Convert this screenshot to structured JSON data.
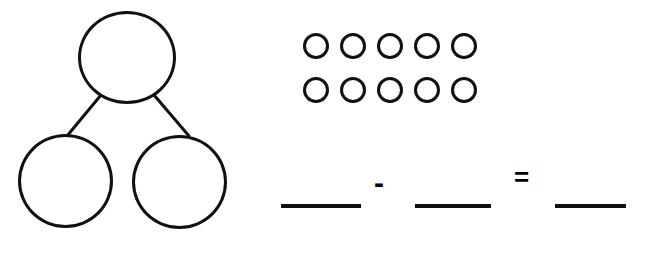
{
  "worksheet": {
    "type": "number-bond-subtraction",
    "background_color": "#ffffff",
    "ink_color": "#111111"
  },
  "number_bond": {
    "label": "number bond",
    "whole": {
      "name": "whole",
      "value": ""
    },
    "part_left": {
      "name": "part-left",
      "value": ""
    },
    "part_right": {
      "name": "part-right",
      "value": ""
    }
  },
  "counters": {
    "label": "counters",
    "total": 10,
    "shape": "circle-outline",
    "rows": [
      {
        "count": 5,
        "items": [
          "circle",
          "circle",
          "circle",
          "circle",
          "circle"
        ]
      },
      {
        "count": 5,
        "items": [
          "circle",
          "circle",
          "circle",
          "circle",
          "circle"
        ]
      }
    ]
  },
  "equation": {
    "label": "subtraction equation",
    "expression": "___ - ___ = ___",
    "minus_sign": "-",
    "equals_sign": "=",
    "blanks": [
      {
        "name": "minuend",
        "value": ""
      },
      {
        "name": "subtrahend",
        "value": ""
      },
      {
        "name": "difference",
        "value": ""
      }
    ]
  }
}
